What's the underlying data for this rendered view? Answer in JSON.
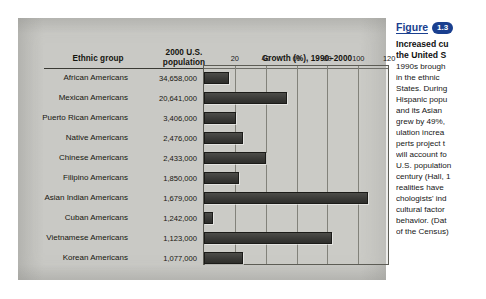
{
  "figure_panel": {
    "name": "ethnic-growth-figure",
    "headers": {
      "ethnic_group": "Ethnic group",
      "population": "2000 U.S.\npopulation",
      "growth": "Growth (%), 1990–2000"
    }
  },
  "caption": {
    "figure_word": "Figure",
    "figure_number": "1.3",
    "title_line1": "Increased cu",
    "title_line2": "the United S",
    "body": "1990s brough\nin the ethnic \nStates. During\nHispanic popu\nand its Asian \ngrew by 49%,\nulation increa\nperts project t\nwill account fo\nU.S. population\ncentury (Hall, 1\nrealities have \nchologists' ind\ncultural factor\nbehavior. (Dat\nof the Census)"
  },
  "chart_data": {
    "type": "bar",
    "orientation": "horizontal",
    "title": "Growth (%), 1990–2000",
    "xlabel": "Growth (%), 1990–2000",
    "ylabel": "Ethnic group",
    "xlim": [
      0,
      120
    ],
    "xticks": [
      20,
      40,
      60,
      80,
      100,
      120
    ],
    "grid": true,
    "legend": null,
    "bar_color": "#3a3a37",
    "categories": [
      "African Americans",
      "Mexican Americans",
      "Puerto Rican Americans",
      "Native Americans",
      "Chinese Americans",
      "Filipino Americans",
      "Asian Indian Americans",
      "Cuban Americans",
      "Vietnamese Americans",
      "Korean Americans"
    ],
    "values": [
      16,
      54,
      21,
      25,
      40,
      23,
      106,
      6,
      83,
      25
    ],
    "populations": [
      "34,658,000",
      "20,641,000",
      "3,406,000",
      "2,476,000",
      "2,433,000",
      "1,850,000",
      "1,679,000",
      "1,242,000",
      "1,123,000",
      "1,077,000"
    ],
    "population_values": [
      34658000,
      20641000,
      3406000,
      2476000,
      2433000,
      1850000,
      1679000,
      1242000,
      1123000,
      1077000
    ]
  }
}
